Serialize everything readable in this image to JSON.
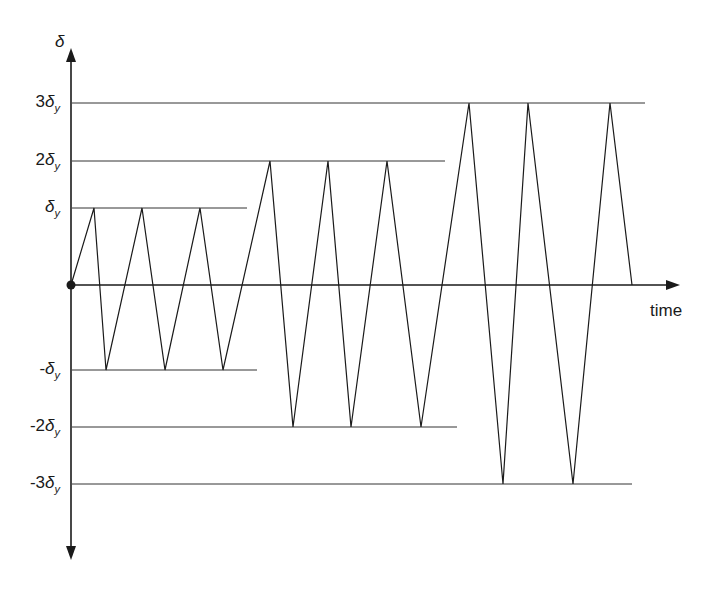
{
  "diagram": {
    "type": "cyclic loading protocol",
    "y_axis_label": "δ",
    "x_axis_label": "time",
    "levels": [
      {
        "name": "3δy",
        "prefix": "3",
        "sym": "δ",
        "sub": "y",
        "y": 103,
        "line_end": 645
      },
      {
        "name": "2δy",
        "prefix": "2",
        "sym": "δ",
        "sub": "y",
        "y": 161,
        "line_end": 445
      },
      {
        "name": "δy",
        "prefix": "",
        "sym": "δ",
        "sub": "y",
        "y": 208,
        "line_end": 247
      },
      {
        "name": "-δy",
        "prefix": "-",
        "sym": "δ",
        "sub": "y",
        "y": 370,
        "line_end": 257
      },
      {
        "name": "-2δy",
        "prefix": "-2",
        "sym": "δ",
        "sub": "y",
        "y": 427,
        "line_end": 457
      },
      {
        "name": "-3δy",
        "prefix": "-3",
        "sym": "δ",
        "sub": "y",
        "y": 484,
        "line_end": 632
      }
    ],
    "cycles": [
      {
        "amplitude": "δy",
        "count": 3
      },
      {
        "amplitude": "2δy",
        "count": 3
      },
      {
        "amplitude": "3δy",
        "count": 2.5
      }
    ],
    "waveform_points": [
      [
        71,
        285
      ],
      [
        94,
        208
      ],
      [
        106,
        370
      ],
      [
        142,
        208
      ],
      [
        165,
        370
      ],
      [
        200,
        208
      ],
      [
        223,
        370
      ],
      [
        270,
        161
      ],
      [
        293,
        427
      ],
      [
        328,
        161
      ],
      [
        351,
        427
      ],
      [
        387,
        161
      ],
      [
        421,
        427
      ],
      [
        469,
        103
      ],
      [
        503,
        484
      ],
      [
        528,
        103
      ],
      [
        573,
        484
      ],
      [
        610,
        103
      ],
      [
        632,
        285
      ]
    ],
    "colors": {
      "line": "#1a1a1a",
      "grid": "#333333",
      "background": "#ffffff"
    }
  }
}
